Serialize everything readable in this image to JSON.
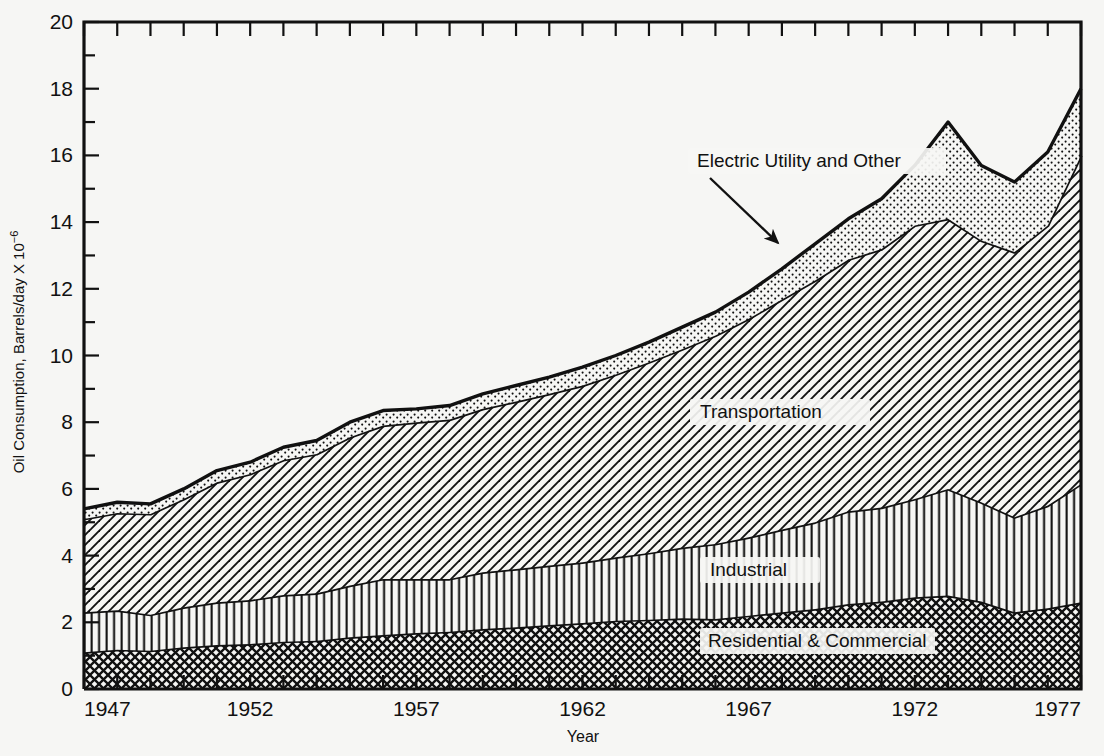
{
  "axes": {
    "y_title": "Oil Consumption, Barrels/day X 10",
    "y_title_exp": "−6",
    "x_title": "Year",
    "y_ticks": [
      "0",
      "2",
      "4",
      "6",
      "8",
      "10",
      "12",
      "14",
      "16",
      "18",
      "20"
    ],
    "x_ticks": [
      "1947",
      "1952",
      "1957",
      "1962",
      "1967",
      "1972",
      "1977"
    ]
  },
  "series_labels": {
    "transportation": "Transportation",
    "industrial": "Industrial",
    "residential": "Residential & Commercial",
    "electric": "Electric Utility and Other"
  },
  "colors": {
    "ink": "#111111",
    "paper": "#f6f6f4"
  },
  "chart_data": {
    "type": "area",
    "title": "",
    "xlabel": "Year",
    "ylabel": "Oil Consumption, Barrels/day X 10^-6",
    "xlim": [
      1947,
      1977
    ],
    "ylim": [
      0,
      20
    ],
    "grid": false,
    "legend": "in-plot labels",
    "stacked": true,
    "annotations": [
      {
        "text": "Electric Utility and Other",
        "x": 1967.4,
        "y": 14.6,
        "points_to": {
          "x": 1968.6,
          "y": 13.1
        }
      }
    ],
    "x": [
      1947,
      1948,
      1949,
      1950,
      1951,
      1952,
      1953,
      1954,
      1955,
      1956,
      1957,
      1958,
      1959,
      1960,
      1961,
      1962,
      1963,
      1964,
      1965,
      1966,
      1967,
      1968,
      1969,
      1970,
      1971,
      1972,
      1973,
      1974,
      1975,
      1976,
      1977
    ],
    "series": [
      {
        "name": "Residential & Commercial",
        "values": [
          1.1,
          1.18,
          1.15,
          1.25,
          1.32,
          1.35,
          1.42,
          1.45,
          1.55,
          1.62,
          1.68,
          1.72,
          1.8,
          1.85,
          1.92,
          1.98,
          2.05,
          2.08,
          2.12,
          2.1,
          2.2,
          2.3,
          2.4,
          2.55,
          2.62,
          2.75,
          2.8,
          2.62,
          2.3,
          2.42,
          2.6
        ],
        "pattern": "diagonal-crosshatch"
      },
      {
        "name": "Industrial",
        "values": [
          1.2,
          1.18,
          1.08,
          1.2,
          1.28,
          1.32,
          1.4,
          1.42,
          1.55,
          1.68,
          1.62,
          1.58,
          1.7,
          1.75,
          1.78,
          1.82,
          1.9,
          2.0,
          2.12,
          2.25,
          2.35,
          2.48,
          2.6,
          2.78,
          2.82,
          2.95,
          3.2,
          2.98,
          2.85,
          3.08,
          3.55
        ],
        "pattern": "vertical-lines"
      },
      {
        "name": "Transportation",
        "values": [
          2.8,
          2.92,
          3.02,
          3.25,
          3.6,
          3.78,
          4.05,
          4.18,
          4.45,
          4.6,
          4.7,
          4.78,
          4.9,
          5.02,
          5.15,
          5.3,
          5.48,
          5.72,
          5.95,
          6.25,
          6.55,
          6.9,
          7.25,
          7.55,
          7.75,
          8.2,
          8.1,
          7.85,
          7.95,
          8.4,
          9.85
        ],
        "pattern": "diagonal-lines"
      },
      {
        "name": "Electric Utility and Other",
        "values": [
          0.3,
          0.32,
          0.3,
          0.3,
          0.35,
          0.35,
          0.38,
          0.4,
          0.45,
          0.45,
          0.4,
          0.42,
          0.45,
          0.48,
          0.5,
          0.55,
          0.57,
          0.6,
          0.66,
          0.7,
          0.8,
          0.92,
          1.1,
          1.22,
          1.51,
          1.8,
          2.9,
          2.25,
          2.1,
          2.2,
          2.0
        ],
        "pattern": "stipple"
      }
    ],
    "totals": [
      5.4,
      5.6,
      5.55,
      6.0,
      6.55,
      6.8,
      7.25,
      7.45,
      8.0,
      8.35,
      8.4,
      8.5,
      8.85,
      9.1,
      9.35,
      9.65,
      10.0,
      10.4,
      10.85,
      11.3,
      11.9,
      12.6,
      13.35,
      14.1,
      14.7,
      15.7,
      17.0,
      15.7,
      15.2,
      16.1,
      18.0
    ]
  }
}
